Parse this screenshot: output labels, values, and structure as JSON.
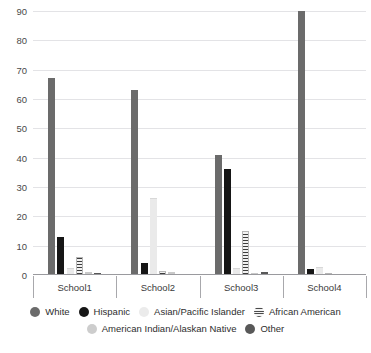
{
  "chart_data": {
    "type": "bar",
    "title": "",
    "xlabel": "",
    "ylabel": "",
    "ylim": [
      0,
      90
    ],
    "yticks": [
      0,
      10,
      20,
      30,
      40,
      50,
      60,
      70,
      80,
      90
    ],
    "grid": true,
    "legend_position": "bottom",
    "categories": [
      "School1",
      "School2",
      "School3",
      "School4"
    ],
    "series": [
      {
        "name": "White",
        "color": "#6b6b6b",
        "values": [
          67,
          63,
          41,
          90
        ]
      },
      {
        "name": "Hispanic",
        "color": "#161616",
        "values": [
          13,
          4,
          36,
          2
        ]
      },
      {
        "name": "Asian/Pacific Islander",
        "color": "#eaeaea",
        "values": [
          2,
          26,
          2,
          2.5
        ]
      },
      {
        "name": "African American",
        "color": "#3d3d3d",
        "values": [
          6,
          1.5,
          15,
          0.5
        ]
      },
      {
        "name": "American Indian/Alaskan Native",
        "color": "#c9c9c9",
        "values": [
          1,
          1,
          0.5,
          0
        ]
      },
      {
        "name": "Other",
        "color": "#585858",
        "values": [
          0.5,
          0,
          1,
          0
        ]
      }
    ]
  },
  "axis": {
    "tick_labels": [
      "90",
      "80",
      "70",
      "60",
      "50",
      "40",
      "30",
      "20",
      "10",
      "0"
    ]
  },
  "legend": {
    "row1": [
      "White",
      "Hispanic",
      "Asian/Pacific Islander",
      "African American"
    ],
    "row2": [
      "American Indian/Alaskan Native",
      "Other"
    ]
  },
  "title_sliver": ""
}
